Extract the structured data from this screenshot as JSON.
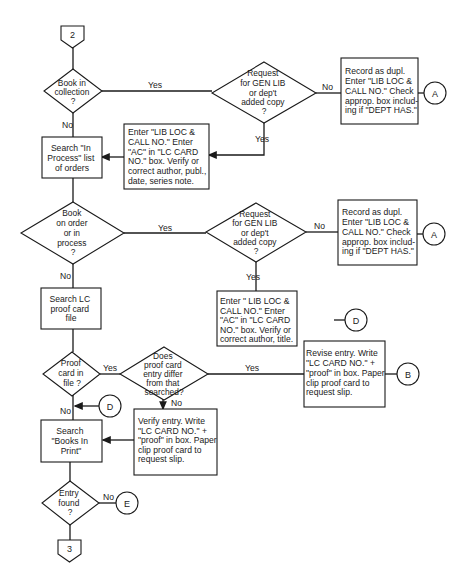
{
  "diagram": {
    "type": "flowchart",
    "offpage_connectors": {
      "start": "2",
      "end": "3"
    },
    "decisions": {
      "book_in_collection": [
        "Book in",
        "collection",
        "?"
      ],
      "request_gen_lib_1": [
        "Request",
        "for GEN LIB",
        "or dep't",
        "added copy",
        "?"
      ],
      "book_on_order": [
        "Book",
        "on order",
        "or in",
        "process",
        "?"
      ],
      "request_gen_lib_2": [
        "Request",
        "for GEN LIB",
        "or dep't",
        "added copy",
        "?"
      ],
      "proof_card_in_file": [
        "Proof",
        "card in",
        "file ?"
      ],
      "proof_card_differ": [
        "Does",
        "proof card",
        "entry differ",
        "from that",
        "searched?"
      ],
      "entry_found": [
        "Entry",
        "found",
        "?"
      ]
    },
    "processes": {
      "record_dupl_1": [
        "Record as dupl.",
        "Enter \"LIB LOC &",
        "CALL NO.\" Check",
        "approp. box includ-",
        "ing if \"DEPT HAS.\""
      ],
      "enter_lib_loc_1": [
        "Enter \"LIB LOC &",
        "CALL NO.\" Enter",
        "\"AC\" in \"LC CARD",
        "NO.\" box. Verify or",
        "correct author, publ.,",
        "date, series note."
      ],
      "search_in_process": [
        "Search \"In",
        "Process\" list",
        "of orders"
      ],
      "record_dupl_2": [
        "Record as dupl.",
        "Enter \"LIB LOC &",
        "CALL NO.\" Check",
        "approp. box includ-",
        "ing if \"DEPT HAS.\""
      ],
      "search_lc_proof": [
        "Search LC",
        "proof card",
        "file"
      ],
      "enter_lib_loc_2": [
        "Enter \" LIB LOC &",
        "CALL NO.\" Enter",
        "\"AC\" in \"LC CARD",
        "NO.\" box. Verify or",
        "correct author, title."
      ],
      "revise_entry": [
        "Revise entry. Write",
        "\"LC CARD NO.\" +",
        "\"proof\" in box. Paper",
        "clip proof card to",
        "request slip."
      ],
      "verify_entry": [
        "Verify entry.  Write",
        "\"LC CARD NO.\" +",
        "\"proof\" in box. Paper",
        "clip proof card to",
        "request slip."
      ],
      "search_books_in_print": [
        "Search",
        "\"Books In",
        "Print\""
      ]
    },
    "connectors": {
      "a1": "A",
      "a2": "A",
      "d1": "D",
      "d2": "D",
      "b": "B",
      "e": "E"
    },
    "edge_labels": {
      "yes": "Yes",
      "no": "No",
      "yes_faded": "Yes"
    }
  }
}
